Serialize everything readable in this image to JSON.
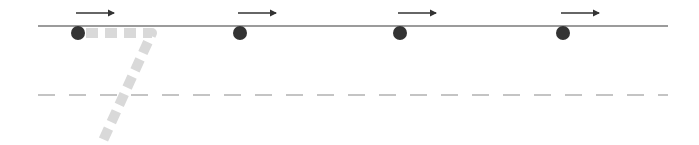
{
  "diagram": {
    "colors": {
      "solid_line": "#7a7a7a",
      "dashed_line": "#8a8a8a",
      "dots": "#333333",
      "arrows": "#333333",
      "trail": "#d9d9d9"
    },
    "solid_line": {
      "x1": 38,
      "x2": 668,
      "y": 26
    },
    "dashed_line": {
      "x1": 38,
      "x2": 668,
      "y": 95
    },
    "particles": [
      {
        "x": 78,
        "y": 33,
        "arrow_x1": 76,
        "arrow_x2": 118,
        "arrow_y": 13
      },
      {
        "x": 240,
        "y": 33,
        "arrow_x1": 238,
        "arrow_x2": 280,
        "arrow_y": 13
      },
      {
        "x": 400,
        "y": 33,
        "arrow_x1": 398,
        "arrow_x2": 440,
        "arrow_y": 13
      },
      {
        "x": 563,
        "y": 33,
        "arrow_x1": 561,
        "arrow_x2": 603,
        "arrow_y": 13
      }
    ],
    "trail_path": "M 86 33 L 152 33 L 101 145"
  }
}
